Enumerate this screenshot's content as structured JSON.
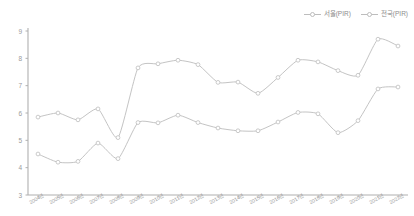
{
  "chart_data": {
    "type": "line",
    "title": "",
    "xlabel": "",
    "ylabel": "",
    "ylim": [
      3,
      9
    ],
    "yticks": [
      9,
      8,
      7,
      6,
      5,
      4,
      3
    ],
    "grid": false,
    "legend_position": "top-right",
    "categories": [
      "2004년",
      "2005년",
      "2006년",
      "2007년",
      "2008년",
      "2009년",
      "2010년",
      "2011년",
      "2012년",
      "2013년",
      "2014년",
      "2015년",
      "2016년",
      "2017년",
      "2018년",
      "2019년",
      "2020년",
      "2021년",
      "2022년"
    ],
    "series": [
      {
        "name": "서울(PIR)",
        "color": "#c4c4c4",
        "values": [
          5.85,
          6.0,
          5.75,
          6.15,
          5.1,
          7.65,
          7.8,
          7.93,
          7.77,
          7.12,
          7.13,
          6.72,
          7.3,
          7.93,
          7.87,
          7.55,
          7.38,
          8.7,
          8.45
        ]
      },
      {
        "name": "전국(PIR)",
        "color": "#c4c4c4",
        "values": [
          4.5,
          4.2,
          4.23,
          4.9,
          4.33,
          5.65,
          5.64,
          5.92,
          5.65,
          5.45,
          5.35,
          5.35,
          5.67,
          6.02,
          5.97,
          5.28,
          5.72,
          6.88,
          6.95
        ]
      }
    ]
  },
  "legend": {
    "items": [
      {
        "label": "서울(PIR)"
      },
      {
        "label": "전국(PIR)"
      }
    ]
  },
  "axis": {
    "y_labels": [
      "9",
      "8",
      "7",
      "6",
      "5",
      "4",
      "3"
    ]
  }
}
